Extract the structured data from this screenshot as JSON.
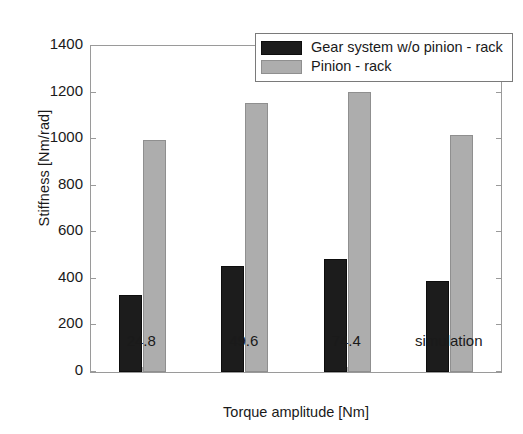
{
  "chart_data": {
    "type": "bar",
    "title": "",
    "xlabel": "Torque amplitude [Nm]",
    "ylabel": "Stiffness [Nm/rad]",
    "categories": [
      "24.8",
      "49.6",
      "74.4",
      "simulation"
    ],
    "series": [
      {
        "name": "Gear system w/o pinion - rack",
        "color": "#1c1c1c",
        "values": [
          329,
          457,
          487,
          393
        ]
      },
      {
        "name": "Pinion - rack",
        "color": "#adadad",
        "values": [
          995,
          1157,
          1204,
          1020
        ]
      }
    ],
    "ylim": [
      0,
      1400
    ],
    "yticks": [
      0,
      200,
      400,
      600,
      800,
      1000,
      1200,
      1400
    ],
    "ytick_labels": [
      "0",
      "200",
      "400",
      "600",
      "800",
      "1000",
      "1200",
      "1400"
    ],
    "grid": false,
    "legend_position": "top-right"
  }
}
